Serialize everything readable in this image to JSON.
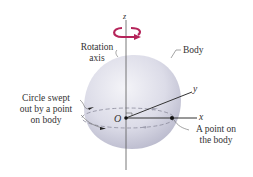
{
  "diagram": {
    "type": "rotating-rigid-body",
    "colors": {
      "rotation_arrow": "#b5245a",
      "body_fill": "#d9d9e6",
      "axis_line": "#444444",
      "text": "#333333"
    },
    "axes": {
      "z": "z",
      "x": "x",
      "y": "y",
      "origin": "O"
    },
    "labels": {
      "rotation_axis_line1": "Rotation",
      "rotation_axis_line2": "axis",
      "body": "Body",
      "circle_line1": "Circle swept",
      "circle_line2": "out by a point",
      "circle_line3": "on body",
      "point_line1": "A point on",
      "point_line2": "the body"
    }
  }
}
